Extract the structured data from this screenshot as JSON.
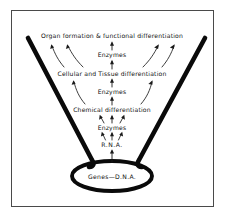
{
  "figure": {
    "background_color": "#ffffff",
    "ink_color": "#101010",
    "frame_color": "#4a4a4a",
    "levels": [
      {
        "id": "organ",
        "label": "Organ formation & functional differentiation",
        "y": 36,
        "kind": "stage"
      },
      {
        "id": "enzymes3",
        "label": "Enzymes",
        "y": 55,
        "kind": "enzyme"
      },
      {
        "id": "cellular",
        "label": "Cellular and Tissue differentiation",
        "y": 74,
        "kind": "stage"
      },
      {
        "id": "enzymes2",
        "label": "Enzymes",
        "y": 92,
        "kind": "enzyme"
      },
      {
        "id": "chemical",
        "label": "Chemical differentiation",
        "y": 110,
        "kind": "stage"
      },
      {
        "id": "enzymes1",
        "label": "Enzymes",
        "y": 128,
        "kind": "enzyme"
      },
      {
        "id": "rna",
        "label": "R.N.A.",
        "y": 145,
        "kind": "molecule"
      },
      {
        "id": "genes",
        "label": "Genes—D.N.A.",
        "y": 176,
        "kind": "source"
      }
    ],
    "funnel": {
      "left_top_x": 28,
      "left_top_y": 38,
      "right_top_x": 205,
      "right_top_y": 38,
      "neck_y": 166
    },
    "oval": {
      "cx": 112,
      "cy": 176,
      "rx": 40,
      "ry": 15
    },
    "frame": {
      "x": 11,
      "y": 10,
      "width": 203,
      "height": 197
    }
  }
}
